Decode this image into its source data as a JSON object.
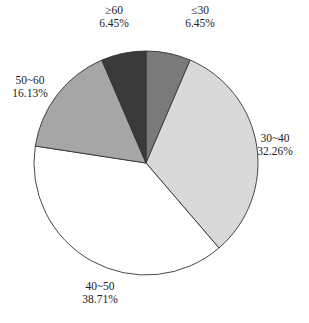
{
  "chart_data": {
    "type": "pie",
    "title": "",
    "start_angle_deg": 90,
    "direction": "clockwise",
    "center": [
      146,
      163
    ],
    "radius": 112,
    "stroke": "#333333",
    "slices": [
      {
        "label": "≤30",
        "value": 6.45,
        "pct_text": "6.45%",
        "color": "#7a7a7a",
        "label_pos": [
          200,
          14
        ],
        "anchor": "middle"
      },
      {
        "label": "30~40",
        "value": 32.26,
        "pct_text": "32.26%",
        "color": "#d9d9d9",
        "label_pos": [
          275,
          142
        ],
        "anchor": "middle"
      },
      {
        "label": "40~50",
        "value": 38.71,
        "pct_text": "38.71%",
        "color": "#ffffff",
        "label_pos": [
          100,
          290
        ],
        "anchor": "middle"
      },
      {
        "label": "50~60",
        "value": 16.13,
        "pct_text": "16.13%",
        "color": "#a6a6a6",
        "label_pos": [
          30,
          84
        ],
        "anchor": "middle"
      },
      {
        "label": "≥60",
        "value": 6.45,
        "pct_text": "6.45%",
        "color": "#3a3a3a",
        "label_pos": [
          114,
          14
        ],
        "anchor": "middle"
      }
    ],
    "categories": [
      "≤30",
      "30~40",
      "40~50",
      "50~60",
      "≥60"
    ],
    "values": [
      6.45,
      32.26,
      38.71,
      16.13,
      6.45
    ],
    "legend": "none (labels placed outside slices)"
  }
}
